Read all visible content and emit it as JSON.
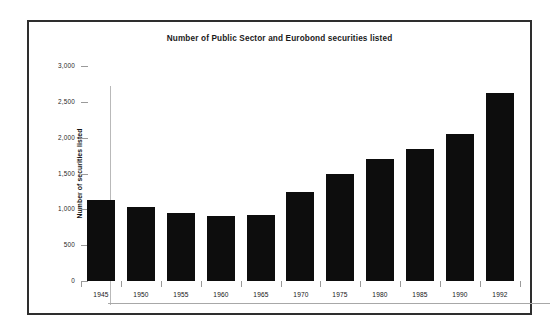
{
  "figure": {
    "width": 560,
    "height": 335,
    "background_color": "#ffffff",
    "frame_color": "#2e2e2e",
    "bar_color": "#0d0d0d",
    "axis_color": "#a8a8a8",
    "text_color": "#1a1a1a"
  },
  "chart_data": {
    "type": "bar",
    "title": "Number of Public Sector and Eurobond securities listed",
    "subtitle": "",
    "xlabel": "",
    "ylabel": "Number of securities listed",
    "categories": [
      "1945",
      "1950",
      "1955",
      "1960",
      "1965",
      "1970",
      "1975",
      "1980",
      "1985",
      "1990",
      "1992"
    ],
    "values": [
      1130,
      1030,
      950,
      910,
      915,
      1240,
      1495,
      1700,
      1840,
      2050,
      2620
    ],
    "ylim": [
      0,
      3000
    ],
    "yticks": [
      0,
      500,
      1000,
      1500,
      2000,
      2500,
      3000
    ],
    "ytick_labels": [
      "0",
      "500",
      "1,000",
      "1,500",
      "2,000",
      "2,500",
      "3,000"
    ],
    "xtick_labels": [
      "1945",
      "1950",
      "1955",
      "1960",
      "1965",
      "1970",
      "1975",
      "1980",
      "1985",
      "1990",
      "1992"
    ],
    "grid": false,
    "legend": null,
    "legend_position": "none",
    "series": [
      {
        "name": "Number of securities listed",
        "color": "#0d0d0d",
        "values": [
          1130,
          1030,
          950,
          910,
          915,
          1240,
          1495,
          1700,
          1840,
          2050,
          2620
        ]
      }
    ],
    "annotations": []
  }
}
